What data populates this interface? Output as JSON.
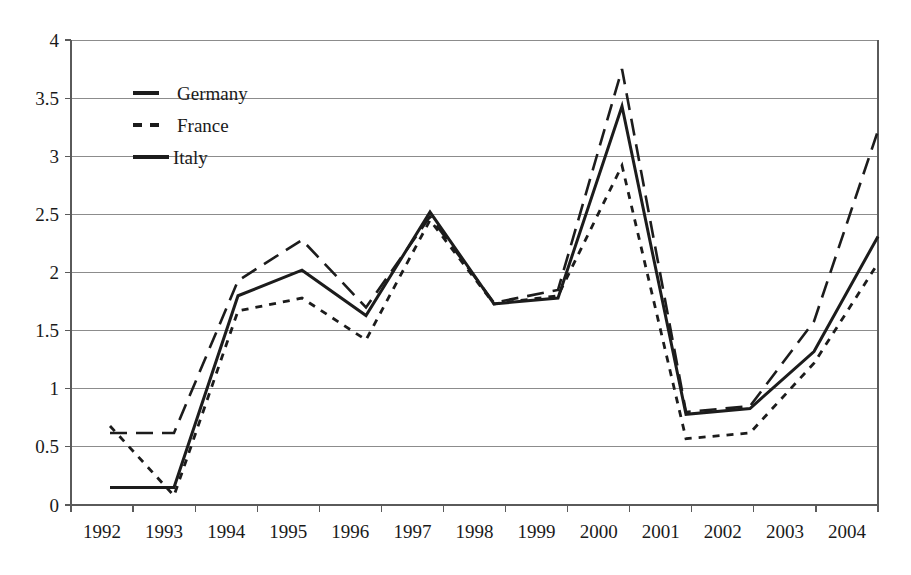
{
  "chart_data": {
    "type": "line",
    "title": "",
    "xlabel": "",
    "ylabel": "",
    "categories": [
      "1992",
      "1993",
      "1994",
      "1995",
      "1996",
      "1997",
      "1998",
      "1999",
      "2000",
      "2001",
      "2002",
      "2003",
      "2004"
    ],
    "ylim": [
      0,
      4
    ],
    "ytick_values": [
      0,
      0.5,
      1,
      1.5,
      2,
      2.5,
      3,
      3.5,
      4
    ],
    "ytick_labels": [
      "0",
      "0.5",
      "1",
      "1.5",
      "2",
      "2.5",
      "3",
      "3.5",
      "4"
    ],
    "grid": true,
    "legend_position": "top-left",
    "series": [
      {
        "name": "Germany",
        "style": "long-dash",
        "values": [
          0.62,
          0.62,
          1.93,
          2.28,
          1.7,
          2.48,
          1.74,
          1.85,
          3.75,
          0.8,
          0.85,
          1.58,
          3.22
        ]
      },
      {
        "name": "France",
        "style": "short-dash",
        "values": [
          0.68,
          0.08,
          1.67,
          1.78,
          1.42,
          2.45,
          1.73,
          1.8,
          2.92,
          0.57,
          0.62,
          1.22,
          2.08
        ]
      },
      {
        "name": "Italy",
        "style": "solid",
        "values": [
          0.15,
          0.15,
          1.8,
          2.02,
          1.63,
          2.52,
          1.73,
          1.78,
          3.43,
          0.78,
          0.83,
          1.32,
          2.31
        ]
      }
    ]
  },
  "legend": {
    "entries": [
      {
        "label": "Germany"
      },
      {
        "label": "France"
      },
      {
        "label": "Italy"
      }
    ]
  },
  "colors": {
    "series_stroke": "#1c1c1c",
    "gridline": "#8c8c8c",
    "axis": "#5a5a5a",
    "background": "#ffffff",
    "text": "#1a1a1a"
  }
}
